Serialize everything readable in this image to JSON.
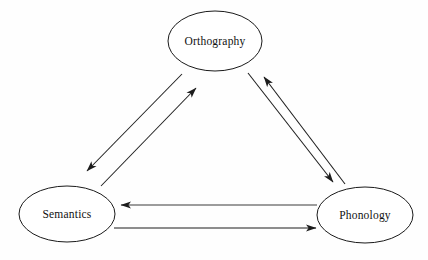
{
  "diagram": {
    "background_color": "#fefefe",
    "line_color": "#1c1c1c",
    "text_color": "#111111",
    "nodes": [
      {
        "id": "orthography",
        "label": "Orthography",
        "cx": 215,
        "cy": 41,
        "rx": 47,
        "ry": 30
      },
      {
        "id": "semantics",
        "label": "Semantics",
        "cx": 67,
        "cy": 214,
        "rx": 48,
        "ry": 28
      },
      {
        "id": "phonology",
        "label": "Phonology",
        "cx": 365,
        "cy": 215,
        "rx": 48,
        "ry": 28
      }
    ],
    "edges": [
      {
        "id": "orthography-to-semantics",
        "from": "orthography",
        "to": "semantics",
        "direction": "down-left",
        "x1": 182,
        "y1": 74,
        "x2": 87,
        "y2": 171
      },
      {
        "id": "semantics-to-orthography",
        "from": "semantics",
        "to": "orthography",
        "direction": "up-right",
        "x1": 101,
        "y1": 186,
        "x2": 196,
        "y2": 88
      },
      {
        "id": "orthography-to-phonology",
        "from": "orthography",
        "to": "phonology",
        "direction": "down-right",
        "x1": 248,
        "y1": 73,
        "x2": 333,
        "y2": 182
      },
      {
        "id": "phonology-to-orthography",
        "from": "phonology",
        "to": "orthography",
        "direction": "up-left",
        "x1": 345,
        "y1": 184,
        "x2": 264,
        "y2": 77
      },
      {
        "id": "phonology-to-semantics",
        "from": "phonology",
        "to": "semantics",
        "direction": "left",
        "x1": 317,
        "y1": 205,
        "x2": 121,
        "y2": 205
      },
      {
        "id": "semantics-to-phonology",
        "from": "semantics",
        "to": "phonology",
        "direction": "right",
        "x1": 114,
        "y1": 228,
        "x2": 316,
        "y2": 228
      }
    ]
  }
}
